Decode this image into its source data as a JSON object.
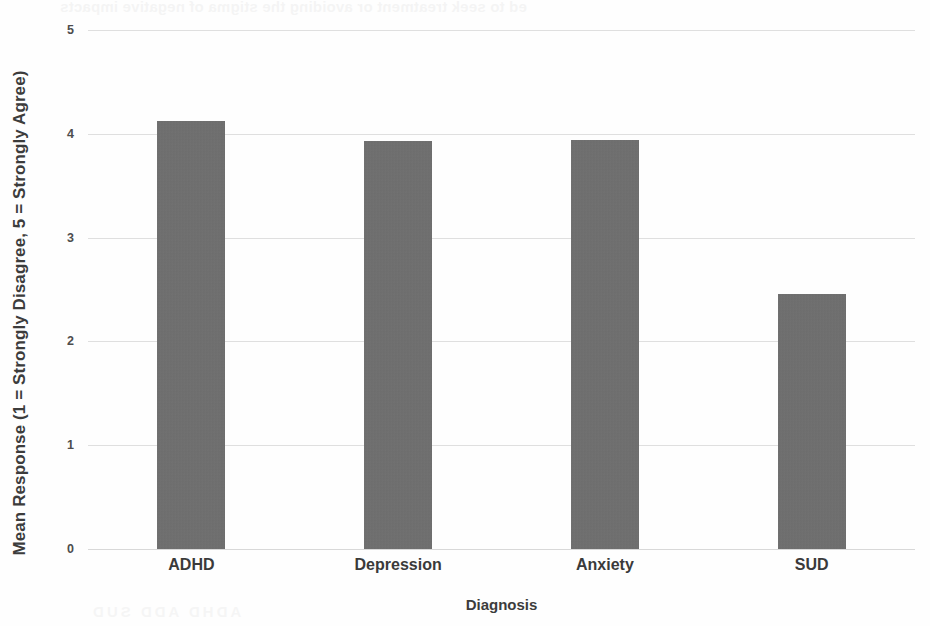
{
  "chart_data": {
    "type": "bar",
    "title": "",
    "subtitle": "",
    "categories": [
      "ADHD",
      "Depression",
      "Anxiety",
      "SUD"
    ],
    "values": [
      4.12,
      3.93,
      3.94,
      2.46
    ],
    "xlabel": "Diagnosis",
    "ylabel": "Mean Response (1 = Strongly Disagree, 5 = Strongly Agree)",
    "ylim": [
      0,
      5
    ],
    "yticks": [
      "0",
      "1",
      "2",
      "3",
      "4",
      "5"
    ],
    "ytick_values": [
      0,
      1,
      2,
      3,
      4,
      5
    ],
    "grid": "horizontal",
    "legend": "none",
    "bar_color": "#6e6e6e",
    "gridline_color": "#dddddd",
    "background_color": "#fefefe"
  },
  "axes": {
    "y_title": "Mean Response (1 = Strongly Disagree, 5 = Strongly Agree)",
    "x_title": "Diagnosis"
  },
  "scan_artifacts": {
    "top_bleedthrough": "ed to seek treatment or avoiding the stigma of negative impacts",
    "bottom_bleedthrough": "ADHD       ADD       SUD"
  }
}
